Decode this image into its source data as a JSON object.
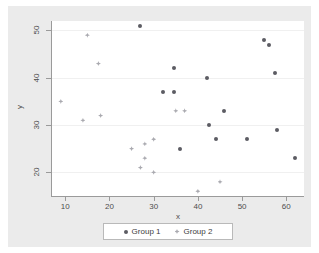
{
  "chart_data": {
    "type": "scatter",
    "title": "",
    "xlabel": "x",
    "ylabel": "y",
    "xlim": [
      7,
      64
    ],
    "ylim": [
      15,
      52
    ],
    "xticks": [
      10,
      20,
      30,
      40,
      50,
      60
    ],
    "yticks": [
      20,
      30,
      40,
      50
    ],
    "grid": true,
    "grid_axis": "y",
    "legend_position": "bottom-center",
    "colors": {
      "group1": "#5c5c63",
      "group2": "#aaaab0",
      "background": "#ebebeb",
      "plot_background": "#ffffff",
      "axis": "#9a9a9a",
      "gridline": "#f0f0f0"
    },
    "series": [
      {
        "name": "Group 1",
        "marker": "circle",
        "color": "#5c5c63",
        "points": [
          [
            27,
            51
          ],
          [
            34.5,
            42
          ],
          [
            42,
            40
          ],
          [
            32,
            37
          ],
          [
            34.5,
            37
          ],
          [
            55,
            48
          ],
          [
            56,
            47
          ],
          [
            57.5,
            41
          ],
          [
            46,
            33
          ],
          [
            42.5,
            30
          ],
          [
            44,
            27
          ],
          [
            51,
            27
          ],
          [
            58,
            29
          ],
          [
            36,
            25
          ],
          [
            62,
            23
          ]
        ]
      },
      {
        "name": "Group 2",
        "marker": "diamond",
        "color": "#aaaab0",
        "points": [
          [
            15,
            49
          ],
          [
            17.5,
            43
          ],
          [
            9,
            35
          ],
          [
            14,
            31
          ],
          [
            18,
            32
          ],
          [
            35,
            33
          ],
          [
            37,
            33
          ],
          [
            30,
            27
          ],
          [
            28,
            26
          ],
          [
            25,
            25
          ],
          [
            28,
            23
          ],
          [
            27,
            21
          ],
          [
            30,
            20
          ],
          [
            45,
            18
          ],
          [
            40,
            16
          ]
        ]
      }
    ]
  },
  "legend": {
    "entries": [
      {
        "label": "Group 1",
        "marker": "circle-marker"
      },
      {
        "label": "Group 2",
        "marker": "diamond-marker"
      }
    ]
  },
  "axes": {
    "x_title": "x",
    "y_title": "y",
    "x_tick_labels": [
      "10",
      "20",
      "30",
      "40",
      "50",
      "60"
    ],
    "y_tick_labels": [
      "20",
      "30",
      "40",
      "50"
    ]
  }
}
